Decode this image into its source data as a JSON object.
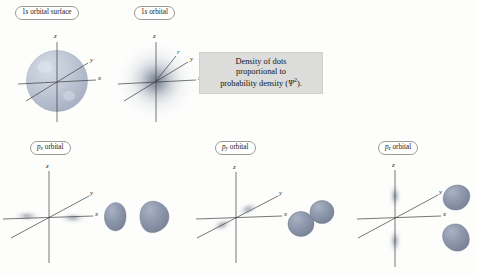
{
  "figure": {
    "title_visible": false,
    "background_color": "#fdfdfc",
    "lobe_color": "#8b95a9",
    "cloud_color": "#7d879b",
    "sphere_color": "#b9c2cf",
    "axis_color": "#3c3c3c"
  },
  "panels": [
    {
      "id": "1s-orbital-surface",
      "label": "1s orbital surface",
      "label_prefix": "1",
      "label_italic": "s",
      "label_suffix": " orbital surface",
      "kind": "sphere",
      "axes": [
        "z",
        "y",
        "x"
      ]
    },
    {
      "id": "1s-orbital",
      "label": "1s orbital",
      "label_prefix": "1",
      "label_italic": "s",
      "label_suffix": " orbital",
      "kind": "dot-cloud-spherical",
      "axes": [
        "z",
        "r",
        "y",
        "x"
      ]
    },
    {
      "id": "px-orbital",
      "label": "px orbital",
      "label_italic": "p",
      "label_sub": "x",
      "label_suffix": " orbital",
      "kind": "dot-cloud-px",
      "axes": [
        "z",
        "y",
        "x"
      ],
      "lobe_count": 2,
      "lobe_orientation": "horizontal-teardrop"
    },
    {
      "id": "py-orbital",
      "label": "py orbital",
      "label_italic": "p",
      "label_sub": "y",
      "label_suffix": " orbital",
      "kind": "dot-cloud-py",
      "axes": [
        "z",
        "y",
        "x"
      ],
      "lobe_count": 2,
      "lobe_orientation": "diagonal-round"
    },
    {
      "id": "pz-orbital",
      "label": "pz orbital",
      "label_italic": "p",
      "label_sub": "z",
      "label_suffix": " orbital",
      "kind": "dot-cloud-pz",
      "axes": [
        "z",
        "y",
        "x"
      ],
      "lobe_count": 2,
      "lobe_orientation": "vertical-teardrop"
    }
  ],
  "note": {
    "line1": "Density of dots",
    "line2": "proportional to",
    "line3_pre": "probability density (",
    "line3_psi": "Ψ",
    "line3_sup": "2",
    "line3_post": ")."
  },
  "axis_labels": {
    "z": "z",
    "y": "y",
    "x": "x",
    "r": "r"
  }
}
